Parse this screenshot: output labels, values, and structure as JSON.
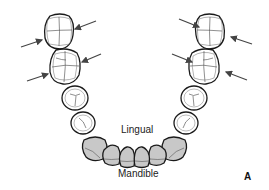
{
  "figure": {
    "labels": {
      "inner": "Lingual",
      "arch": "Mandible",
      "panel": "A"
    },
    "colors": {
      "outline": "#1a1a1a",
      "anterior_fill": "#c8c8c8",
      "posterior_fill": "#ffffff",
      "arrow": "#444444"
    },
    "teeth": [
      {
        "id": "left-molar-2",
        "type": "molar",
        "side": "left"
      },
      {
        "id": "left-molar-1",
        "type": "molar",
        "side": "left"
      },
      {
        "id": "left-premolar-2",
        "type": "premolar",
        "side": "left"
      },
      {
        "id": "left-premolar-1",
        "type": "premolar",
        "side": "left"
      },
      {
        "id": "left-canine",
        "type": "canine",
        "side": "left"
      },
      {
        "id": "left-lateral-incisor",
        "type": "incisor",
        "side": "left"
      },
      {
        "id": "left-central-incisor",
        "type": "incisor",
        "side": "left"
      },
      {
        "id": "right-central-incisor",
        "type": "incisor",
        "side": "right"
      },
      {
        "id": "right-lateral-incisor",
        "type": "incisor",
        "side": "right"
      },
      {
        "id": "right-canine",
        "type": "canine",
        "side": "right"
      },
      {
        "id": "right-premolar-1",
        "type": "premolar",
        "side": "right"
      },
      {
        "id": "right-premolar-2",
        "type": "premolar",
        "side": "right"
      },
      {
        "id": "right-molar-1",
        "type": "molar",
        "side": "right"
      },
      {
        "id": "right-molar-2",
        "type": "molar",
        "side": "right"
      }
    ],
    "arrows_count": 8
  }
}
